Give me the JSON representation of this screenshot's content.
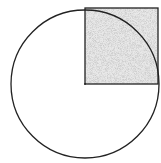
{
  "diagram": {
    "type": "geometry",
    "circle": {
      "cx": 85,
      "cy": 84,
      "r": 75,
      "stroke": "#222222",
      "fill": "#ffffff"
    },
    "square": {
      "x": 85,
      "y": 8,
      "size": 75,
      "stroke": "#222222",
      "fill": "#d9d9d9",
      "pattern": "stipple"
    },
    "center_point": {
      "x": 85,
      "y": 84
    }
  }
}
